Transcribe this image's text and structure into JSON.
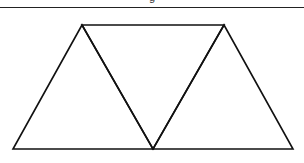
{
  "caption": {
    "text": "g"
  },
  "diagram": {
    "stroke": "#111111",
    "background": "#ffffff",
    "shapes": [
      "triangle-up-left",
      "triangle-down-middle",
      "triangle-up-right"
    ]
  }
}
